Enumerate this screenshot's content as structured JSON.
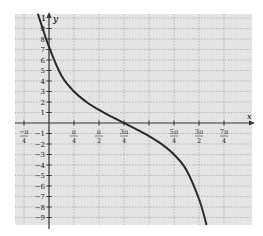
{
  "chart_data": {
    "type": "line",
    "title": "",
    "xlabel": "x",
    "ylabel": "y",
    "function_description": "y = -3 tan(x/2 - 3π/8)",
    "x_ticks": [
      {
        "value": -0.7854,
        "num": "−π",
        "den": "4"
      },
      {
        "value": 0.7854,
        "num": "π",
        "den": "4"
      },
      {
        "value": 1.5708,
        "num": "π",
        "den": "2"
      },
      {
        "value": 2.3562,
        "num": "3π",
        "den": "4"
      },
      {
        "value": 3.1416,
        "num": "",
        "den": ""
      },
      {
        "value": 3.927,
        "num": "5π",
        "den": "4"
      },
      {
        "value": 4.7124,
        "num": "3π",
        "den": "2"
      },
      {
        "value": 5.4978,
        "num": "7π",
        "den": "4"
      }
    ],
    "y_ticks": [
      9,
      8,
      7,
      6,
      5,
      4,
      3,
      2,
      1,
      -1,
      -2,
      -3,
      -4,
      -5,
      -6,
      -7,
      -8,
      -9
    ],
    "y_top_label": "1",
    "xlim": [
      -1.07,
      6.0
    ],
    "ylim": [
      -9.8,
      10.4
    ],
    "grid": true,
    "legend": null,
    "series": [
      {
        "name": "curve",
        "x": [
          -0.35,
          0,
          0.3927,
          0.7854,
          1.1781,
          1.5708,
          1.9635,
          2.3562,
          2.7489,
          3.1416,
          3.5343,
          3.927,
          4.3197,
          4.7124,
          4.95
        ],
        "y": [
          10.4,
          7.24,
          4.49,
          3.0,
          2.0,
          1.24,
          0.6,
          0.0,
          -0.6,
          -1.24,
          -2.0,
          -3.0,
          -4.49,
          -7.24,
          -9.7
        ]
      }
    ],
    "colors": {
      "plot_background": "#e4e4e4",
      "grid": "#9a9a9a",
      "axis": "#333333",
      "curve": "#2a2a2a"
    }
  }
}
